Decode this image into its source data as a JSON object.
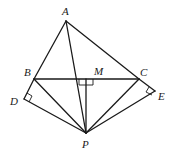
{
  "diagram": {
    "type": "geometry",
    "points": {
      "A": {
        "label": "A",
        "x": 66,
        "y": 21
      },
      "B": {
        "label": "B",
        "x": 34,
        "y": 79
      },
      "C": {
        "label": "C",
        "x": 139,
        "y": 79
      },
      "M": {
        "label": "M",
        "x": 86,
        "y": 79
      },
      "D": {
        "label": "D",
        "x": 24,
        "y": 99
      },
      "E": {
        "label": "E",
        "x": 155,
        "y": 91
      },
      "P": {
        "label": "P",
        "x": 86,
        "y": 133
      }
    },
    "segments": [
      [
        "A",
        "B"
      ],
      [
        "A",
        "C"
      ],
      [
        "A",
        "P"
      ],
      [
        "B",
        "C"
      ],
      [
        "M",
        "P"
      ],
      [
        "B",
        "D"
      ],
      [
        "D",
        "P"
      ],
      [
        "B",
        "P"
      ],
      [
        "C",
        "P"
      ],
      [
        "C",
        "E"
      ],
      [
        "E",
        "P"
      ]
    ],
    "right_angles": [
      "M",
      "D",
      "E"
    ]
  }
}
